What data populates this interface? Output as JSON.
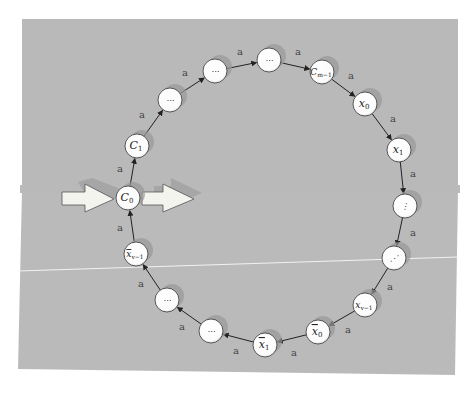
{
  "diagram": {
    "type": "directed-cycle",
    "background_color": "#b9b9b9",
    "node_fill": "#ffffff",
    "node_shadow": "#999999",
    "edge_label": "a",
    "nodes": [
      {
        "id": "C0",
        "label": "C",
        "sub": "0",
        "bar": false,
        "x": 128,
        "y": 198
      },
      {
        "id": "C1",
        "label": "C",
        "sub": "1",
        "bar": false,
        "x": 137,
        "y": 146
      },
      {
        "id": "dots1",
        "label": "⋯",
        "sub": "",
        "bar": false,
        "x": 170,
        "y": 100
      },
      {
        "id": "dots2",
        "label": "⋯",
        "sub": "",
        "bar": false,
        "x": 215,
        "y": 71
      },
      {
        "id": "dots3",
        "label": "⋯",
        "sub": "",
        "bar": false,
        "x": 269,
        "y": 60
      },
      {
        "id": "Cm-1",
        "label": "C",
        "sub": "m−1",
        "bar": false,
        "x": 322,
        "y": 72
      },
      {
        "id": "x0",
        "label": "x",
        "sub": "0",
        "bar": false,
        "x": 365,
        "y": 104
      },
      {
        "id": "x1",
        "label": "x",
        "sub": "1",
        "bar": false,
        "x": 399,
        "y": 150
      },
      {
        "id": "vdots",
        "label": "⋮",
        "sub": "",
        "bar": false,
        "x": 405,
        "y": 206
      },
      {
        "id": "ddots",
        "label": "⋰",
        "sub": "",
        "bar": false,
        "x": 394,
        "y": 258
      },
      {
        "id": "xv-1",
        "label": "x",
        "sub": "v−1",
        "bar": false,
        "x": 365,
        "y": 305
      },
      {
        "id": "xbar0",
        "label": "x",
        "sub": "0",
        "bar": true,
        "x": 318,
        "y": 332
      },
      {
        "id": "xbar1",
        "label": "x",
        "sub": "1",
        "bar": true,
        "x": 265,
        "y": 345
      },
      {
        "id": "dots4",
        "label": "⋯",
        "sub": "",
        "bar": false,
        "x": 211,
        "y": 331
      },
      {
        "id": "dots5",
        "label": "⋯",
        "sub": "",
        "bar": false,
        "x": 167,
        "y": 300
      },
      {
        "id": "xbarv-1",
        "label": "x",
        "sub": "v−1",
        "bar": true,
        "x": 136,
        "y": 254
      }
    ],
    "edges": [
      {
        "from": "C0",
        "to": "C1",
        "label": "a",
        "lx": 120,
        "ly": 172
      },
      {
        "from": "C1",
        "to": "dots1",
        "label": "a",
        "lx": 142,
        "ly": 118
      },
      {
        "from": "dots1",
        "to": "dots2",
        "label": "a",
        "lx": 185,
        "ly": 76
      },
      {
        "from": "dots2",
        "to": "dots3",
        "label": "a",
        "lx": 240,
        "ly": 55
      },
      {
        "from": "dots3",
        "to": "Cm-1",
        "label": "a",
        "lx": 298,
        "ly": 55
      },
      {
        "from": "Cm-1",
        "to": "x0",
        "label": "a",
        "lx": 351,
        "ly": 79
      },
      {
        "from": "x0",
        "to": "x1",
        "label": "a",
        "lx": 393,
        "ly": 122
      },
      {
        "from": "x1",
        "to": "vdots",
        "label": "a",
        "lx": 413,
        "ly": 177
      },
      {
        "from": "vdots",
        "to": "ddots",
        "label": "a",
        "lx": 413,
        "ly": 236
      },
      {
        "from": "ddots",
        "to": "xv-1",
        "label": "a",
        "lx": 390,
        "ly": 290
      },
      {
        "from": "xv-1",
        "to": "xbar0",
        "label": "a",
        "lx": 348,
        "ly": 333
      },
      {
        "from": "xbar0",
        "to": "xbar1",
        "label": "a",
        "lx": 294,
        "ly": 356
      },
      {
        "from": "xbar1",
        "to": "dots4",
        "label": "a",
        "lx": 236,
        "ly": 354
      },
      {
        "from": "dots4",
        "to": "dots5",
        "label": "a",
        "lx": 182,
        "ly": 330
      },
      {
        "from": "dots5",
        "to": "xbarv-1",
        "label": "a",
        "lx": 141,
        "ly": 287
      },
      {
        "from": "xbarv-1",
        "to": "C0",
        "label": "a",
        "lx": 120,
        "ly": 231
      }
    ],
    "entry_arrow": {
      "label": "input-arrow"
    },
    "exit_arrow": {
      "label": "output-arrow"
    }
  }
}
